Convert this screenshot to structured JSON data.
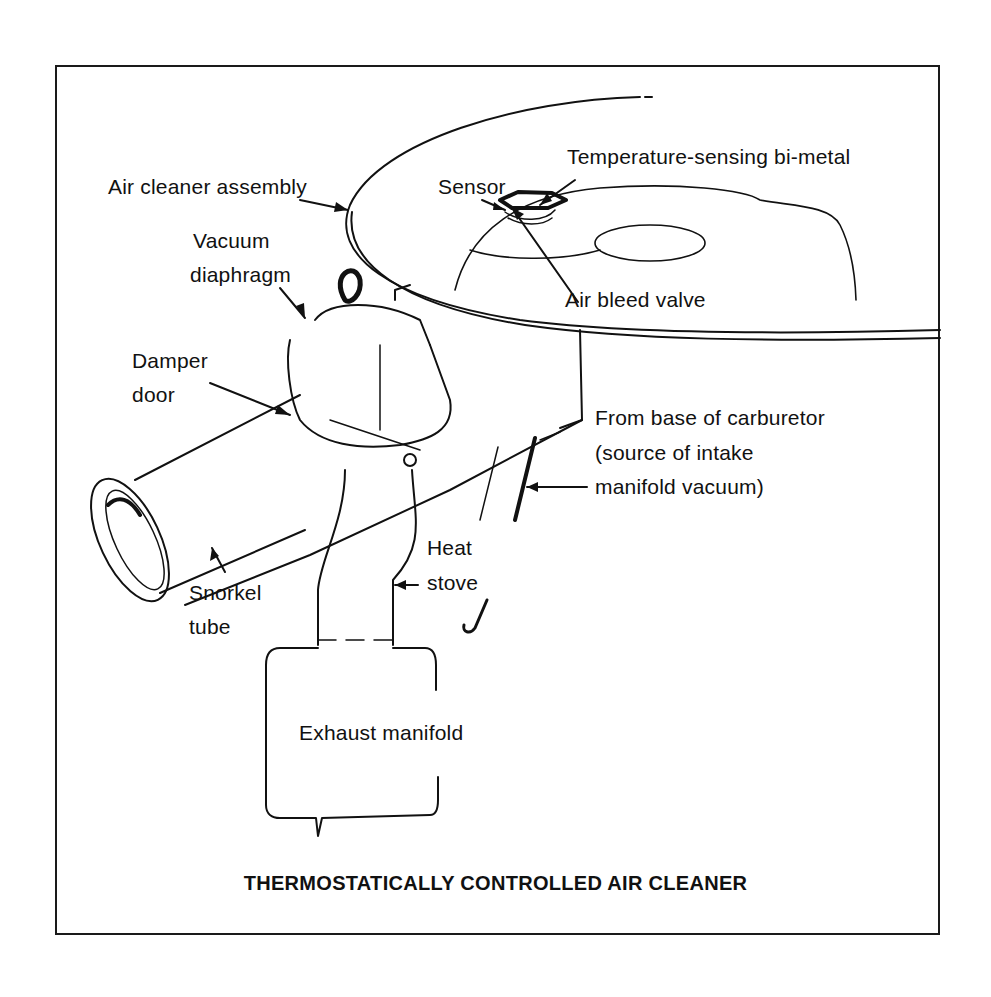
{
  "figure": {
    "title": "THERMOSTATICALLY CONTROLLED AIR CLEANER",
    "line_color": "#111111",
    "background": "#ffffff"
  },
  "labels": {
    "air_cleaner_assembly": "Air cleaner assembly",
    "sensor": "Sensor",
    "temperature_bimetal": "Temperature-sensing bi-metal",
    "air_bleed_valve": "Air bleed valve",
    "vacuum_diaphragm_line1": "Vacuum",
    "vacuum_diaphragm_line2": "diaphragm",
    "damper_door_line1": "Damper",
    "damper_door_line2": "door",
    "carburetor_line1": "From base of carburetor",
    "carburetor_line2": "(source of intake",
    "carburetor_line3": "manifold vacuum)",
    "heat_stove_line1": "Heat",
    "heat_stove_line2": "stove",
    "snorkel_line1": "Snorkel",
    "snorkel_line2": "tube",
    "exhaust_manifold": "Exhaust manifold"
  }
}
